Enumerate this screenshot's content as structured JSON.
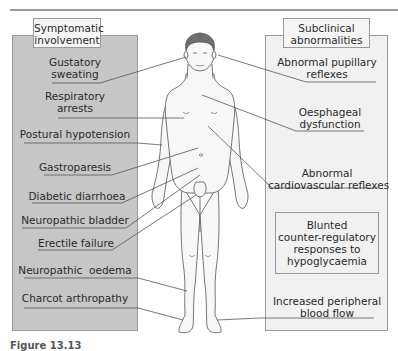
{
  "figure": {
    "caption": "Figure 13.13",
    "colors": {
      "left_panel_fill": "#c6c6c6",
      "right_panel_fill": "#f1f1f1",
      "border": "#9a9a9a",
      "leader_line": "#555555",
      "body_outline": "#666666",
      "hair": "#6e6e6e"
    },
    "left_panel": {
      "title": "Symptomatic involvement",
      "title_lines": [
        "Symptomatic",
        "involvement"
      ],
      "items": [
        {
          "lines": [
            "Gustatory",
            "sweating"
          ]
        },
        {
          "lines": [
            "Respiratory",
            "arrests"
          ]
        },
        {
          "lines": [
            "Postural hypotension"
          ]
        },
        {
          "lines": [
            "Gastroparesis"
          ]
        },
        {
          "lines": [
            "Diabetic diarrhoea"
          ]
        },
        {
          "lines": [
            "Neuropathic bladder"
          ]
        },
        {
          "lines": [
            "Erectile failure"
          ]
        },
        {
          "lines": [
            "Neuropathic  oedema"
          ]
        },
        {
          "lines": [
            "Charcot arthropathy"
          ]
        }
      ]
    },
    "right_panel": {
      "title": "Subclinical abnormalities",
      "title_lines": [
        "Subclinical",
        "abnormalities"
      ],
      "items": [
        {
          "lines": [
            "Abnormal pupillary",
            "reflexes"
          ]
        },
        {
          "lines": [
            "Oesphageal",
            "dysfunction"
          ]
        },
        {
          "lines": [
            "Abnormal",
            "cardiovascular reflexes"
          ]
        },
        {
          "lines": [
            "Blunted",
            "counter-regulatory",
            "responses to",
            "hypoglycaemia"
          ]
        },
        {
          "lines": [
            "Increased peripheral",
            "blood flow"
          ]
        }
      ]
    }
  }
}
